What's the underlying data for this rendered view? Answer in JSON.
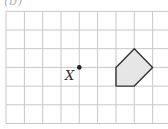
{
  "figure": {
    "part_label": "(b)",
    "point_label": "X",
    "grid": {
      "columns": 9,
      "rows": 6,
      "line_color": "#c8c8c8"
    },
    "shape": {
      "type": "pentagon",
      "fill": "#e6e6e6",
      "stroke": "#333333",
      "vertices_grid": [
        [
          7,
          2
        ],
        [
          8,
          3
        ],
        [
          7,
          4
        ],
        [
          6,
          4
        ],
        [
          6,
          3
        ]
      ]
    },
    "point": {
      "grid": [
        4,
        3
      ]
    }
  }
}
